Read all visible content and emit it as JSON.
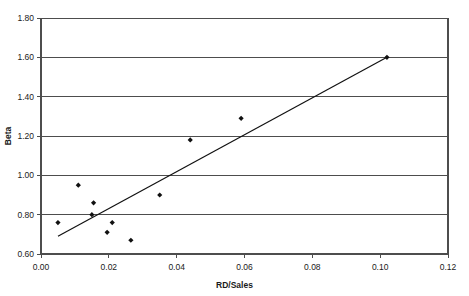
{
  "chart_data": {
    "type": "scatter",
    "title": "",
    "xlabel": "RD/Sales",
    "ylabel": "Beta",
    "xlim": [
      0.0,
      0.12
    ],
    "ylim": [
      0.6,
      1.8
    ],
    "xticks": [
      0.0,
      0.02,
      0.04,
      0.06,
      0.08,
      0.1,
      0.12
    ],
    "xtick_labels": [
      "0.00",
      "0.02",
      "0.04",
      "0.06",
      "0.08",
      "0.10",
      "0.12"
    ],
    "yticks": [
      0.6,
      0.8,
      1.0,
      1.2,
      1.4,
      1.6,
      1.8
    ],
    "ytick_labels": [
      "0.60",
      "0.80",
      "1.00",
      "1.20",
      "1.40",
      "1.60",
      "1.80"
    ],
    "grid": "horizontal",
    "legend": "none",
    "marker_color": "#111111",
    "marker_shape": "diamond",
    "line_color": "#111111",
    "series": [
      {
        "name": "observations",
        "points": [
          {
            "x": 0.005,
            "y": 0.76
          },
          {
            "x": 0.011,
            "y": 0.95
          },
          {
            "x": 0.015,
            "y": 0.8
          },
          {
            "x": 0.0155,
            "y": 0.86
          },
          {
            "x": 0.0195,
            "y": 0.71
          },
          {
            "x": 0.021,
            "y": 0.76
          },
          {
            "x": 0.0265,
            "y": 0.67
          },
          {
            "x": 0.035,
            "y": 0.9
          },
          {
            "x": 0.044,
            "y": 1.18
          },
          {
            "x": 0.059,
            "y": 1.29
          },
          {
            "x": 0.102,
            "y": 1.6
          }
        ]
      }
    ],
    "trendline": {
      "name": "linear-fit",
      "x0": 0.005,
      "y0": 0.69,
      "x1": 0.102,
      "y1": 1.6
    }
  }
}
